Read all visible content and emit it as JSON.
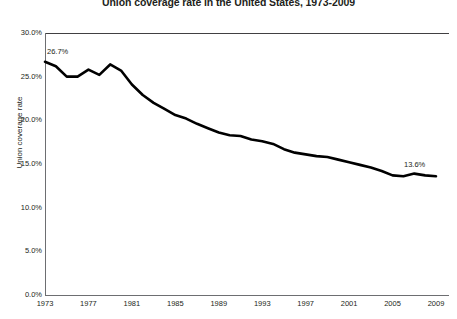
{
  "chart_data": {
    "type": "line",
    "title": "Union coverage rate in the United States, 1973-2009",
    "xlabel": "",
    "ylabel": "Union coverage rate",
    "xlim": [
      1973,
      2009
    ],
    "ylim": [
      0,
      30
    ],
    "grid": false,
    "legend": "none",
    "y_tick_labels": [
      "30.0%",
      "25.0%",
      "20.0%",
      "15.0%",
      "10.0%",
      "5.0%",
      "0.0%"
    ],
    "y_tick_values": [
      30,
      25,
      20,
      15,
      10,
      5,
      0
    ],
    "x_tick_labels": [
      "1973",
      "1977",
      "1981",
      "1985",
      "1989",
      "1993",
      "1997",
      "2001",
      "2005",
      "2009"
    ],
    "x_tick_values": [
      1973,
      1977,
      1981,
      1985,
      1989,
      1993,
      1997,
      2001,
      2005,
      2009
    ],
    "x": [
      1973,
      1974,
      1975,
      1976,
      1977,
      1978,
      1979,
      1980,
      1981,
      1982,
      1983,
      1984,
      1985,
      1986,
      1987,
      1988,
      1989,
      1990,
      1991,
      1992,
      1993,
      1994,
      1995,
      1996,
      1997,
      1998,
      1999,
      2000,
      2001,
      2002,
      2003,
      2004,
      2005,
      2006,
      2007,
      2008,
      2009
    ],
    "values": [
      26.7,
      26.2,
      25.0,
      25.0,
      25.8,
      25.2,
      26.4,
      25.7,
      24.1,
      22.9,
      22.0,
      21.3,
      20.6,
      20.2,
      19.6,
      19.1,
      18.6,
      18.3,
      18.2,
      17.8,
      17.6,
      17.3,
      16.7,
      16.3,
      16.1,
      15.9,
      15.8,
      15.5,
      15.2,
      14.9,
      14.6,
      14.2,
      13.7,
      13.6,
      13.9,
      13.7,
      13.6
    ],
    "annotations": [
      {
        "label": "26.7%",
        "x": 1973,
        "y": 26.7
      },
      {
        "label": "13.6%",
        "x": 2009,
        "y": 13.6
      }
    ],
    "series_color": "#000000",
    "axis_color": "#6d6e71",
    "text_color": "#231f20"
  }
}
